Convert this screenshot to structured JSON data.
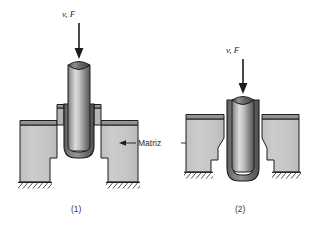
{
  "figure": {
    "type": "technical-diagram",
    "background_color": "#ffffff"
  },
  "labels": {
    "force_label_left": "v, F",
    "force_label_right": "v, F",
    "die_label": "Matriz",
    "stage_one": "(1)",
    "stage_two": "(2)"
  },
  "colors": {
    "die_fill": "#c6c6c6",
    "die_top_edge": "#8f8f8f",
    "workpiece_dark": "#6d6d6d",
    "punch_light": "#d8d8d8",
    "punch_mid": "#9a9a9a",
    "punch_dark": "#4f4f4f",
    "outline": "#1c1c1c",
    "ground_hatch": "#3a3a3a",
    "arrow": "#1c1c1c",
    "text": "#2b2b2b"
  },
  "stages": [
    {
      "id": "stage-1",
      "caption": "(1)",
      "force_arrow": {
        "label": "v, F",
        "direction": "down",
        "x": 79,
        "y_start": 22,
        "y_end": 58
      },
      "punch": {
        "x": 68,
        "width": 22,
        "top": 58,
        "bottom": 146,
        "top_cut": "concave"
      },
      "workpiece": {
        "shape": "cup",
        "wall_thickness": 6,
        "bottom_radius": 11,
        "position": "entering die"
      },
      "die": {
        "left_block_x": 20,
        "right_block_x": 97,
        "block_width": 42,
        "top": 120,
        "bottom": 182
      }
    },
    {
      "id": "stage-2",
      "caption": "(2)",
      "force_arrow": {
        "label": "v, F",
        "direction": "down",
        "x": 243,
        "y_start": 58,
        "y_end": 93
      },
      "punch": {
        "x": 232,
        "width": 22,
        "top": 93,
        "bottom": 178,
        "top_cut": "concave"
      },
      "workpiece": {
        "shape": "cup",
        "wall_thickness": 5,
        "bottom_radius": 11,
        "position": "pushed through die"
      },
      "die": {
        "left_block_x": 186,
        "right_block_x": 259,
        "block_width": 40,
        "top": 115,
        "bottom": 172
      }
    }
  ],
  "annotation": {
    "die_pointer": {
      "text": "Matriz",
      "left_arrow_target_x": 122,
      "right_arrow_target_x": 205,
      "y": 143
    }
  }
}
